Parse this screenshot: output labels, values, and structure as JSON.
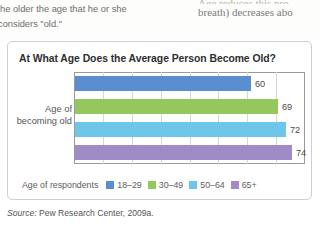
{
  "page_text": {
    "left_column_line1": "he older the age that he or she",
    "left_column_line2": "considers \"old.\"",
    "right_column_line1": "Age reduces this pro",
    "right_column_line2": "breath) decreases abo"
  },
  "figure": {
    "title": "At What Age Does the Average Person Become Old?",
    "axis_label_line1": "Age of",
    "axis_label_line2": "becoming old",
    "legend_title": "Age of respondents",
    "source": "Source: ",
    "source_text": "Pew Research Center, 2009a."
  },
  "chart_data": {
    "type": "bar",
    "orientation": "horizontal",
    "title": "At What Age Does the Average Person Become Old?",
    "xlabel": "",
    "ylabel": "Age of becoming old",
    "categories": [
      "18–29",
      "30–49",
      "50–64",
      "65+"
    ],
    "values": [
      60,
      69,
      72,
      74
    ],
    "value_labels": [
      "60",
      "69",
      "72",
      "74"
    ],
    "colors": [
      "#5a8ed0",
      "#95c75f",
      "#6ec7e8",
      "#9f8bc6"
    ],
    "legend_position": "bottom",
    "grid": true,
    "gridline_count": 7,
    "xlim": [
      0,
      78
    ],
    "legend_entries": [
      {
        "label": "18–29",
        "color": "#5a8ed0"
      },
      {
        "label": "30–49",
        "color": "#95c75f"
      },
      {
        "label": "50–64",
        "color": "#6ec7e8"
      },
      {
        "label": "65+",
        "color": "#9f8bc6"
      }
    ]
  }
}
